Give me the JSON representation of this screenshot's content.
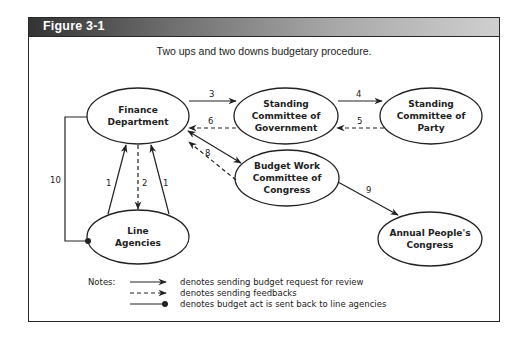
{
  "figure": {
    "label": "Figure 3-1",
    "caption": "Two ups and two downs budgetary procedure."
  },
  "nodes": {
    "finance": {
      "lines": [
        "Finance",
        "Department"
      ]
    },
    "gov": {
      "lines": [
        "Standing",
        "Committee of",
        "Government"
      ]
    },
    "party": {
      "lines": [
        "Standing",
        "Committee of",
        "Party"
      ]
    },
    "budget": {
      "lines": [
        "Budget Work",
        "Committee of",
        "Congress"
      ]
    },
    "apc": {
      "lines": [
        "Annual People's",
        "Congress"
      ]
    },
    "line": {
      "lines": [
        "Line",
        "Agencies"
      ]
    }
  },
  "edges": {
    "e1a": "1",
    "e1b": "1",
    "e2": "2",
    "e3": "3",
    "e4": "4",
    "e5": "5",
    "e6": "6",
    "e8": "8",
    "e9": "9",
    "e10": "10"
  },
  "legend": {
    "title": "Notes:",
    "items": [
      {
        "style": "solid-arrow",
        "text": "denotes sending budget request for review"
      },
      {
        "style": "dashed-arrow",
        "text": "denotes sending feedbacks"
      },
      {
        "style": "solid-dot",
        "text": "denotes budget act is sent back to line agencies"
      }
    ]
  },
  "colors": {
    "stroke": "#222222",
    "header_dark": "#333333",
    "header_light": "#cfcfcf"
  }
}
